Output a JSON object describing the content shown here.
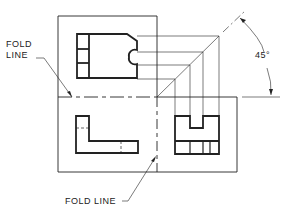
{
  "labels": {
    "fold_line_upper_1": "FOLD",
    "fold_line_upper_2": "LINE",
    "fold_line_lower": "FOLD LINE",
    "angle": "45°"
  },
  "colors": {
    "line": "#222222",
    "background": "#ffffff"
  }
}
